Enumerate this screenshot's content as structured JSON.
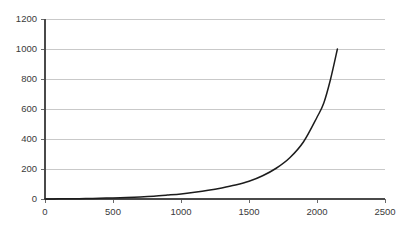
{
  "chart_data": {
    "type": "line",
    "title": "",
    "subtitle": "",
    "xlabel": "",
    "ylabel": "",
    "xlim": [
      0,
      2500
    ],
    "ylim": [
      0,
      1200
    ],
    "grid": true,
    "grid_axis": "y",
    "legend": false,
    "legend_position": "none",
    "colors": {
      "line": "#1c1c1c",
      "gridline": "#c9c9c9",
      "axis": "#4a4a4a",
      "text": "#3a3a3a",
      "background": "#ffffff"
    },
    "xticks": [
      0,
      500,
      1000,
      1500,
      2000,
      2500
    ],
    "xtick_labels": [
      "0",
      "500",
      "1000",
      "1500",
      "2000",
      "2500"
    ],
    "yticks": [
      0,
      200,
      400,
      600,
      800,
      1000,
      1200
    ],
    "ytick_labels": [
      "0",
      "200",
      "400",
      "600",
      "800",
      "1000",
      "1200"
    ],
    "series": [
      {
        "name": "curve",
        "x": [
          0,
          100,
          200,
          300,
          400,
          500,
          600,
          700,
          800,
          900,
          1000,
          1100,
          1200,
          1300,
          1400,
          1500,
          1600,
          1700,
          1800,
          1900,
          2000,
          2050,
          2100,
          2150
        ],
        "y": [
          0,
          1,
          2,
          3,
          5,
          7,
          10,
          14,
          19,
          26,
          34,
          45,
          58,
          74,
          93,
          118,
          155,
          205,
          275,
          380,
          545,
          640,
          800,
          1000
        ]
      }
    ],
    "annotations": []
  }
}
